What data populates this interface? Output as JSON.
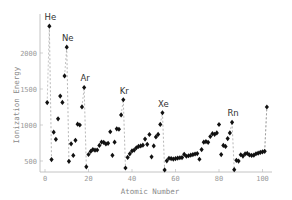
{
  "chart_data": {
    "type": "scatter",
    "title": "",
    "xlabel": "Atomic Number",
    "ylabel": "Ionization Energy",
    "xlim": [
      0,
      105
    ],
    "ylim": [
      350,
      2450
    ],
    "x_ticks": [
      "0",
      "20",
      "40",
      "60",
      "80",
      "100"
    ],
    "y_ticks": [
      "500",
      "1000",
      "1500",
      "2000"
    ],
    "grid": false,
    "legend": null,
    "annotations": [
      {
        "label": "He",
        "x": 2
      },
      {
        "label": "Ne",
        "x": 10
      },
      {
        "label": "Ar",
        "x": 18
      },
      {
        "label": "Kr",
        "x": 36
      },
      {
        "label": "Xe",
        "x": 54
      },
      {
        "label": "Rn",
        "x": 86
      }
    ],
    "dashed_drop_lines_at": [
      2,
      3,
      10,
      11,
      18,
      19,
      36,
      37,
      54,
      55,
      86,
      87,
      101,
      102
    ],
    "x": [
      1,
      2,
      3,
      4,
      5,
      6,
      7,
      8,
      9,
      10,
      11,
      12,
      13,
      14,
      15,
      16,
      17,
      18,
      19,
      20,
      21,
      22,
      23,
      24,
      25,
      26,
      27,
      28,
      29,
      30,
      31,
      32,
      33,
      34,
      35,
      36,
      37,
      38,
      39,
      40,
      41,
      42,
      43,
      44,
      45,
      46,
      47,
      48,
      49,
      50,
      51,
      52,
      53,
      54,
      55,
      56,
      57,
      58,
      59,
      60,
      61,
      62,
      63,
      64,
      65,
      66,
      67,
      68,
      69,
      70,
      71,
      72,
      73,
      74,
      75,
      76,
      77,
      78,
      79,
      80,
      81,
      82,
      83,
      84,
      85,
      86,
      87,
      88,
      89,
      90,
      91,
      92,
      93,
      94,
      95,
      96,
      97,
      98,
      99,
      100,
      101,
      102
    ],
    "values": [
      1312,
      2372,
      520,
      900,
      801,
      1086,
      1402,
      1314,
      1681,
      2081,
      496,
      738,
      578,
      787,
      1012,
      1000,
      1251,
      1521,
      419,
      590,
      633,
      659,
      651,
      653,
      717,
      763,
      760,
      737,
      746,
      906,
      579,
      762,
      947,
      941,
      1140,
      1351,
      403,
      550,
      600,
      640,
      652,
      684,
      702,
      710,
      720,
      804,
      731,
      868,
      558,
      709,
      834,
      869,
      1008,
      1170,
      376,
      503,
      538,
      534,
      527,
      533,
      540,
      545,
      547,
      593,
      566,
      573,
      581,
      589,
      597,
      603,
      524,
      659,
      761,
      770,
      760,
      840,
      880,
      870,
      890,
      1007,
      589,
      716,
      703,
      812,
      890,
      1037,
      380,
      509,
      499,
      587,
      568,
      598,
      605,
      585,
      578,
      581,
      601,
      608,
      619,
      627,
      635,
      1250
    ],
    "point_color": "#111111",
    "drop_line_color": "#888888",
    "axis_color": "#b5b5b5"
  }
}
